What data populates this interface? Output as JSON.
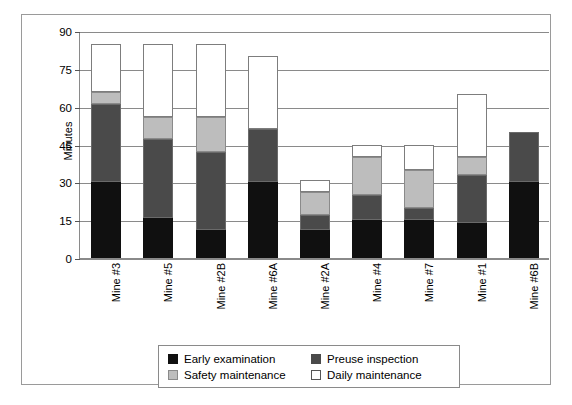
{
  "chart_data": {
    "type": "bar",
    "title": "",
    "subtitle": "",
    "xlabel": "",
    "ylabel": "Minutes",
    "ylim": [
      0,
      90
    ],
    "yticks": [
      0,
      15,
      30,
      45,
      60,
      75,
      90
    ],
    "grid": true,
    "stacked": true,
    "legend_position": "bottom",
    "categories": [
      "Mine #3",
      "Mine #5",
      "Mine #2B",
      "Mine #6A",
      "Mine #2A",
      "Mine #4",
      "Mine #7",
      "Mine #1",
      "Mine #6B"
    ],
    "series": [
      {
        "name": "Early examination",
        "color": "#101010",
        "values": [
          30,
          16,
          11,
          30,
          11,
          15,
          15,
          14,
          30
        ]
      },
      {
        "name": "Preuse inspection",
        "color": "#4a4a4a",
        "values": [
          31,
          31,
          31,
          21,
          6,
          10,
          5,
          19,
          20
        ]
      },
      {
        "name": "Safety maintenance",
        "color": "#bdbdbd",
        "values": [
          5,
          9,
          14,
          0,
          9,
          15,
          15,
          7,
          0
        ]
      },
      {
        "name": "Daily maintenance",
        "color": "#ffffff",
        "values": [
          19,
          29,
          29,
          29,
          5,
          5,
          10,
          25,
          0
        ]
      }
    ],
    "totals": [
      85,
      85,
      85,
      80,
      31,
      45,
      45,
      45,
      30
    ]
  },
  "legend": {
    "items": [
      {
        "label": "Early examination",
        "swatch": "early"
      },
      {
        "label": "Preuse inspection",
        "swatch": "preuse"
      },
      {
        "label": "Safety maintenance",
        "swatch": "safety"
      },
      {
        "label": "Daily maintenance",
        "swatch": "daily"
      }
    ]
  }
}
